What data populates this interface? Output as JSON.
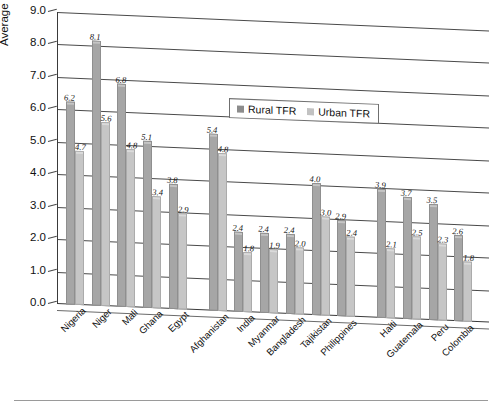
{
  "chart_data": {
    "type": "bar",
    "title": "",
    "xlabel": "",
    "ylabel": "Average lifetime births per woman (TFR)",
    "ylim": [
      0.0,
      9.0
    ],
    "ytick_labels": [
      "9.0",
      "8.0",
      "7.0",
      "6.0",
      "5.0",
      "4.0",
      "3.0",
      "2.0",
      "1.0",
      "0.0"
    ],
    "ytick_values": [
      9.0,
      8.0,
      7.0,
      6.0,
      5.0,
      4.0,
      3.0,
      2.0,
      1.0,
      0.0
    ],
    "grid": true,
    "legend_position": "upper center",
    "categories": [
      "Nigeria",
      "Niger",
      "Mali",
      "Ghana",
      "Egypt",
      "Afghanistan",
      "India",
      "Myanmar",
      "Bangladesh",
      "Tajikistan",
      "Philippines",
      "Haiti",
      "Guatemala",
      "Peru",
      "Colombia"
    ],
    "series": [
      {
        "name": "Rural TFR",
        "color": "#a6a6a6",
        "values": [
          6.2,
          8.1,
          6.8,
          5.1,
          3.8,
          5.4,
          2.4,
          2.4,
          2.4,
          4.0,
          2.9,
          3.9,
          3.7,
          3.5,
          2.6
        ],
        "labels": [
          "6.2",
          "8.1",
          "6.8",
          "5.1",
          "3.8",
          "5.4",
          "2.4",
          "2.4",
          "2.4",
          "4.0",
          "2.9",
          "3.9",
          "3.7",
          "3.5",
          "2.6"
        ]
      },
      {
        "name": "Urban TFR",
        "color": "#c6c6c6",
        "values": [
          4.7,
          5.6,
          4.8,
          3.4,
          2.9,
          4.8,
          1.8,
          1.9,
          2.0,
          3.0,
          2.4,
          2.1,
          2.5,
          2.3,
          1.8
        ],
        "labels": [
          "4.7",
          "5.6",
          "4.8",
          "3.4",
          "2.9",
          "4.8",
          "1.8",
          "1.9",
          "2.0",
          "3.0",
          "2.4",
          "2.1",
          "2.5",
          "2.3",
          "1.8"
        ]
      }
    ],
    "group_gaps_after": [
      4,
      10
    ]
  },
  "legend": {
    "items": [
      {
        "label": "Rural TFR",
        "swatch": "rural"
      },
      {
        "label": "Urban TFR",
        "swatch": "urban"
      }
    ]
  },
  "caption": {
    "text": ""
  },
  "colors": {
    "rural": "#a6a6a6",
    "urban": "#c6c6c6",
    "axis": "#3a3a3a",
    "grid": "#4a4a4a",
    "text": "#111111"
  }
}
